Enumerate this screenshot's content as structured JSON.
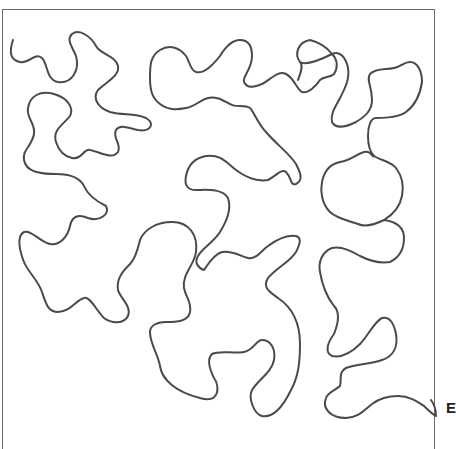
{
  "diagram": {
    "type": "meander-stipple-pattern",
    "end_label": "E",
    "line_color": "#4a4a4a",
    "frame_color": "#6a6a6a"
  }
}
